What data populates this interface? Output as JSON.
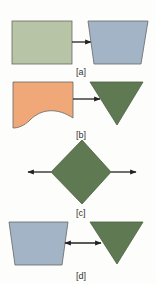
{
  "colors": {
    "green_rect": "#b8c4a6",
    "blue_trap": "#a3b4c6",
    "orange_doc": "#f0a878",
    "dark_green": "#5f7a52",
    "stroke": "#555555",
    "arrow": "#222222"
  },
  "panels": [
    {
      "label": "[a]",
      "shapes": [
        "rectangle",
        "arrow-right",
        "trapezoid"
      ]
    },
    {
      "label": "[b]",
      "shapes": [
        "document",
        "arrow-right",
        "inverted-triangle"
      ]
    },
    {
      "label": "[c]",
      "shapes": [
        "arrow-left",
        "diamond",
        "arrow-right"
      ]
    },
    {
      "label": "[d]",
      "shapes": [
        "trapezoid",
        "double-arrow",
        "inverted-triangle"
      ]
    }
  ]
}
